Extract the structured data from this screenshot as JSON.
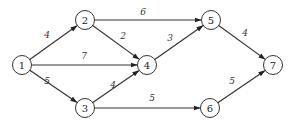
{
  "diagram": {
    "type": "directed-weighted-graph",
    "node_radius": 9.5,
    "nodes": [
      {
        "id": "1",
        "label": "1",
        "x": 22,
        "y": 65
      },
      {
        "id": "2",
        "label": "2",
        "x": 85,
        "y": 20
      },
      {
        "id": "3",
        "label": "3",
        "x": 85,
        "y": 108
      },
      {
        "id": "4",
        "label": "4",
        "x": 147,
        "y": 65
      },
      {
        "id": "5",
        "label": "5",
        "x": 211,
        "y": 20
      },
      {
        "id": "6",
        "label": "6",
        "x": 210,
        "y": 108
      },
      {
        "id": "7",
        "label": "7",
        "x": 273,
        "y": 65
      }
    ],
    "edges": [
      {
        "from": "1",
        "to": "2",
        "weight": "4",
        "lx": 47,
        "ly": 38
      },
      {
        "from": "1",
        "to": "4",
        "weight": "7",
        "lx": 84,
        "ly": 59
      },
      {
        "from": "1",
        "to": "3",
        "weight": "5",
        "lx": 47,
        "ly": 84
      },
      {
        "from": "2",
        "to": "4",
        "weight": "2",
        "lx": 123,
        "ly": 39
      },
      {
        "from": "3",
        "to": "4",
        "weight": "4",
        "lx": 113,
        "ly": 88
      },
      {
        "from": "2",
        "to": "5",
        "weight": "6",
        "lx": 143,
        "ly": 15
      },
      {
        "from": "4",
        "to": "5",
        "weight": "3",
        "lx": 170,
        "ly": 41
      },
      {
        "from": "3",
        "to": "6",
        "weight": "5",
        "lx": 152,
        "ly": 101
      },
      {
        "from": "5",
        "to": "7",
        "weight": "4",
        "lx": 245,
        "ly": 36
      },
      {
        "from": "6",
        "to": "7",
        "weight": "5",
        "lx": 232,
        "ly": 84
      }
    ]
  },
  "colors": {
    "stroke": "#333333",
    "background": "#ffffff"
  }
}
